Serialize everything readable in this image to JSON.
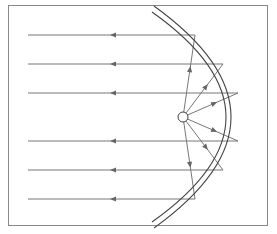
{
  "diagram": {
    "title": "",
    "colors": {
      "background": "#ffffff",
      "frame": "#888888",
      "mirror": "#444444",
      "ray": "#777777",
      "arrow": "#666666",
      "source_fill": "#ffffff",
      "source_stroke": "#444444"
    },
    "frame": {
      "x": 8,
      "y": 5,
      "width": 259,
      "height": 220
    },
    "source": {
      "x": 183,
      "y": 117,
      "r": 5
    },
    "mirror": {
      "inner": "M 152 12 Q 300 117 152 222",
      "outer": "M 154 6 Q 308 117 154 228"
    },
    "rays": [
      {
        "name": "ray-1",
        "hit": [
          195,
          35
        ],
        "y": 35
      },
      {
        "name": "ray-2",
        "hit": [
          223,
          64
        ],
        "y": 64
      },
      {
        "name": "ray-3",
        "hit": [
          238,
          93
        ],
        "y": 93
      },
      {
        "name": "ray-4",
        "hit": [
          238,
          141
        ],
        "y": 141
      },
      {
        "name": "ray-5",
        "hit": [
          223,
          170
        ],
        "y": 170
      },
      {
        "name": "ray-6",
        "hit": [
          195,
          199
        ],
        "y": 199
      }
    ],
    "parallel_start_x": 28,
    "arrow_x": 110
  }
}
